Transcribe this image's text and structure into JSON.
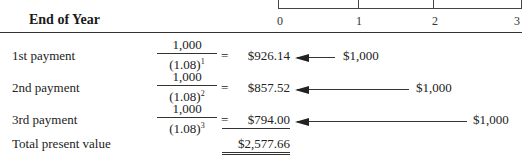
{
  "header": {
    "title": "End of Year"
  },
  "timeline": {
    "ticks": [
      "0",
      "1",
      "2",
      "3"
    ]
  },
  "rows": [
    {
      "label": "1st payment",
      "numerator": "1,000",
      "denominator": "(1.08)",
      "exponent": "1",
      "operator": "=",
      "present_value": "$926.14",
      "cash_flow": "$1,000"
    },
    {
      "label": "2nd payment",
      "numerator": "1,000",
      "denominator": "(1.08)",
      "exponent": "2",
      "operator": "=",
      "present_value": "$857.52",
      "cash_flow": "$1,000"
    },
    {
      "label": "3rd payment",
      "numerator": "1,000",
      "denominator": "(1.08)",
      "exponent": "3",
      "operator": "=",
      "present_value": "$794.00",
      "cash_flow": "$1,000"
    }
  ],
  "total": {
    "label": "Total present value",
    "value": "$2,577.66"
  }
}
